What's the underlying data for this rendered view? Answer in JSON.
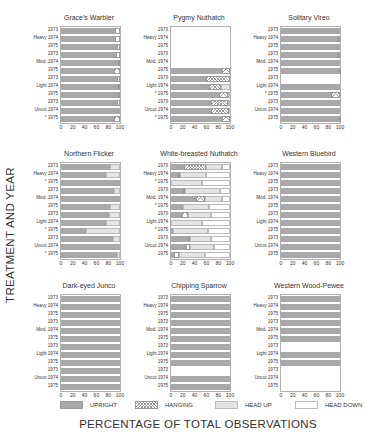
{
  "axis_titles": {
    "y": "TREATMENT AND YEAR",
    "x": "PERCENTAGE OF TOTAL OBSERVATIONS"
  },
  "legend": [
    {
      "key": "upright",
      "label": "UPRIGHT"
    },
    {
      "key": "hanging",
      "label": "HANGING"
    },
    {
      "key": "headup",
      "label": "HEAD UP"
    },
    {
      "key": "headdown",
      "label": "HEAD DOWN"
    }
  ],
  "x_ticks": [
    "0",
    "20",
    "40",
    "60",
    "80",
    "100"
  ],
  "chart_data": {
    "type": "bar",
    "orientation": "horizontal-stacked-100",
    "xlabel": "PERCENTAGE OF TOTAL OBSERVATIONS",
    "ylabel": "TREATMENT AND YEAR",
    "xlim": [
      0,
      100
    ],
    "segments": [
      "upright",
      "hanging",
      "headup",
      "headdown"
    ],
    "row_labels": [
      {
        "treatment": "",
        "year": "1973"
      },
      {
        "treatment": "Heavy",
        "year": "1974"
      },
      {
        "treatment": "",
        "year": "1975"
      },
      {
        "treatment": "",
        "year": "1973"
      },
      {
        "treatment": "Mod.",
        "year": "1974"
      },
      {
        "treatment": "",
        "year": "1975"
      },
      {
        "treatment": "",
        "year": "1973"
      },
      {
        "treatment": "Light",
        "year": "1974"
      },
      {
        "treatment": "",
        "year": "1975"
      },
      {
        "treatment": "",
        "year": "1973"
      },
      {
        "treatment": "Uncut",
        "year": "1974"
      },
      {
        "treatment": "",
        "year": "1975"
      }
    ],
    "panels": [
      {
        "title": "Grace's Warbler",
        "markers": [
          "",
          "",
          "",
          "",
          "",
          "",
          "",
          "",
          "",
          "",
          "",
          "*"
        ],
        "rows": [
          [
            92,
            8,
            0,
            0
          ],
          [
            92,
            8,
            0,
            0
          ],
          [
            95,
            5,
            0,
            0
          ],
          [
            94,
            6,
            0,
            0
          ],
          [
            96,
            4,
            0,
            0
          ],
          [
            90,
            10,
            0,
            0
          ],
          [
            95,
            5,
            0,
            0
          ],
          [
            97,
            3,
            0,
            0
          ],
          [
            97,
            3,
            0,
            0
          ],
          [
            95,
            5,
            0,
            0
          ],
          [
            100,
            0,
            0,
            0
          ],
          [
            90,
            10,
            0,
            0
          ]
        ]
      },
      {
        "title": "Pygmy Nuthatch",
        "markers": [
          "",
          "",
          "",
          "",
          "",
          "",
          "",
          "",
          "*",
          "",
          "",
          "*"
        ],
        "rows": [
          null,
          null,
          null,
          null,
          null,
          [
            86,
            14,
            0,
            0
          ],
          [
            60,
            40,
            0,
            0
          ],
          [
            64,
            20,
            16,
            0
          ],
          [
            82,
            15,
            3,
            0
          ],
          [
            68,
            28,
            4,
            0
          ],
          [
            68,
            30,
            2,
            0
          ],
          [
            86,
            14,
            0,
            0
          ]
        ]
      },
      {
        "title": "Solitary Vireo",
        "markers": [
          "",
          "",
          "",
          "",
          "",
          "",
          "",
          "",
          "*",
          "",
          "",
          ""
        ],
        "rows": [
          [
            100,
            0,
            0,
            0
          ],
          [
            97,
            3,
            0,
            0
          ],
          [
            100,
            0,
            0,
            0
          ],
          [
            96,
            4,
            0,
            0
          ],
          [
            100,
            0,
            0,
            0
          ],
          [
            98,
            2,
            0,
            0
          ],
          null,
          [
            100,
            0,
            0,
            0
          ],
          [
            85,
            15,
            0,
            0
          ],
          [
            100,
            0,
            0,
            0
          ],
          [
            100,
            0,
            0,
            0
          ],
          [
            98,
            2,
            0,
            0
          ]
        ]
      },
      {
        "title": "Northern Flicker",
        "markers": [
          "",
          "",
          "*",
          "",
          "",
          "",
          "",
          "",
          "*",
          "",
          "",
          "*"
        ],
        "rows": [
          [
            83,
            0,
            17,
            0
          ],
          [
            76,
            0,
            24,
            0
          ],
          [
            100,
            0,
            0,
            0
          ],
          [
            90,
            0,
            10,
            0
          ],
          [
            100,
            0,
            0,
            0
          ],
          [
            83,
            0,
            17,
            0
          ],
          [
            82,
            0,
            18,
            0
          ],
          [
            77,
            0,
            23,
            0
          ],
          [
            42,
            0,
            58,
            0
          ],
          [
            88,
            0,
            12,
            0
          ],
          [
            100,
            0,
            0,
            0
          ],
          [
            95,
            0,
            5,
            0
          ]
        ]
      },
      {
        "title": "White-breasted Nuthatch",
        "markers": [
          "",
          "",
          "*",
          "",
          "",
          "*",
          "",
          "",
          "*",
          "",
          "",
          ""
        ],
        "rows": [
          [
            22,
            38,
            27,
            13
          ],
          [
            12,
            3,
            45,
            40
          ],
          [
            0,
            0,
            52,
            48
          ],
          [
            20,
            3,
            60,
            17
          ],
          [
            42,
            15,
            30,
            13
          ],
          [
            20,
            0,
            45,
            35
          ],
          [
            18,
            10,
            40,
            32
          ],
          [
            0,
            0,
            52,
            48
          ],
          [
            3,
            0,
            60,
            37
          ],
          [
            28,
            5,
            35,
            32
          ],
          [
            25,
            8,
            40,
            27
          ],
          [
            5,
            8,
            45,
            42
          ]
        ]
      },
      {
        "title": "Western Bluebird",
        "markers": [
          "",
          "",
          "",
          "",
          "",
          "",
          "",
          "",
          "",
          "",
          "",
          ""
        ],
        "rows": [
          [
            100,
            0,
            0,
            0
          ],
          [
            100,
            0,
            0,
            0
          ],
          [
            100,
            0,
            0,
            0
          ],
          [
            100,
            0,
            0,
            0
          ],
          [
            100,
            0,
            0,
            0
          ],
          [
            100,
            0,
            0,
            0
          ],
          [
            100,
            0,
            0,
            0
          ],
          [
            100,
            0,
            0,
            0
          ],
          [
            100,
            0,
            0,
            0
          ],
          [
            100,
            0,
            0,
            0
          ],
          [
            100,
            0,
            0,
            0
          ],
          [
            100,
            0,
            0,
            0
          ]
        ]
      },
      {
        "title": "Dark-eyed Junco",
        "markers": [
          "",
          "",
          "",
          "",
          "",
          "",
          "",
          "",
          "",
          "",
          "",
          ""
        ],
        "rows": [
          [
            100,
            0,
            0,
            0
          ],
          [
            100,
            0,
            0,
            0
          ],
          [
            100,
            0,
            0,
            0
          ],
          [
            100,
            0,
            0,
            0
          ],
          [
            100,
            0,
            0,
            0
          ],
          [
            100,
            0,
            0,
            0
          ],
          [
            100,
            0,
            0,
            0
          ],
          [
            100,
            0,
            0,
            0
          ],
          [
            100,
            0,
            0,
            0
          ],
          [
            100,
            0,
            0,
            0
          ],
          [
            100,
            0,
            0,
            0
          ],
          [
            100,
            0,
            0,
            0
          ]
        ]
      },
      {
        "title": "Chipping Sparrow",
        "markers": [
          "",
          "",
          "",
          "",
          "",
          "",
          "",
          "",
          "",
          "",
          "",
          ""
        ],
        "rows": [
          [
            100,
            0,
            0,
            0
          ],
          [
            100,
            0,
            0,
            0
          ],
          [
            100,
            0,
            0,
            0
          ],
          [
            100,
            0,
            0,
            0
          ],
          [
            100,
            0,
            0,
            0
          ],
          [
            100,
            0,
            0,
            0
          ],
          [
            100,
            0,
            0,
            0
          ],
          [
            100,
            0,
            0,
            0
          ],
          [
            100,
            0,
            0,
            0
          ],
          null,
          [
            100,
            0,
            0,
            0
          ],
          [
            100,
            0,
            0,
            0
          ]
        ]
      },
      {
        "title": "Western Wood-Pewee",
        "markers": [
          "",
          "",
          "",
          "",
          "",
          "",
          "",
          "",
          "",
          "",
          "",
          ""
        ],
        "rows": [
          [
            100,
            0,
            0,
            0
          ],
          [
            100,
            0,
            0,
            0
          ],
          [
            100,
            0,
            0,
            0
          ],
          [
            100,
            0,
            0,
            0
          ],
          [
            100,
            0,
            0,
            0
          ],
          [
            100,
            0,
            0,
            0
          ],
          null,
          [
            100,
            0,
            0,
            0
          ],
          [
            100,
            0,
            0,
            0
          ],
          null,
          null,
          null
        ]
      }
    ]
  }
}
